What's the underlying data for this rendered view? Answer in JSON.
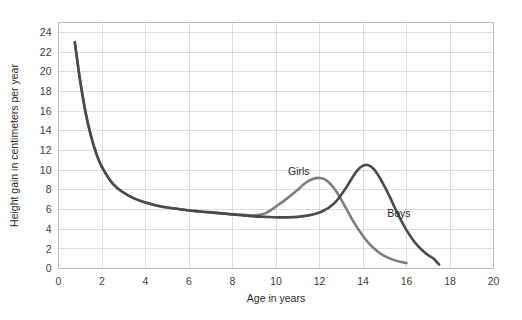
{
  "figure": {
    "background_color": "#ffffff",
    "plot_border_color": "#b9b9b9",
    "grid_color": "#d5d5d5",
    "tick_label_color": "#3c3c3c",
    "axis_title_color": "#2b2b2b"
  },
  "chart_data": {
    "type": "line",
    "title": "",
    "xlabel": "Age in years",
    "ylabel": "Height gain in centimeters per year",
    "xlim": [
      0,
      20
    ],
    "ylim": [
      0,
      25
    ],
    "xticks": [
      0,
      2,
      4,
      6,
      8,
      10,
      12,
      14,
      16,
      18,
      20
    ],
    "xtick_labels": [
      "0",
      "2",
      "4",
      "6",
      "8",
      "10",
      "12",
      "14",
      "16",
      "18",
      "20"
    ],
    "yticks": [
      0,
      2,
      4,
      6,
      8,
      10,
      12,
      14,
      16,
      18,
      20,
      22,
      24
    ],
    "ytick_labels": [
      "0",
      "2",
      "4",
      "6",
      "8",
      "10",
      "12",
      "14",
      "16",
      "18",
      "20",
      "22",
      "24"
    ],
    "grid": true,
    "grid_axes": "both",
    "legend": "inline-annotations",
    "series": [
      {
        "name": "Girls",
        "color": "#7d7d7d",
        "linewidth": 2.6,
        "label_position": {
          "x": 11.05,
          "y": 9.55
        },
        "x": [
          0.75,
          1.0,
          1.25,
          1.5,
          1.75,
          2.0,
          2.5,
          3.0,
          3.5,
          4.0,
          4.5,
          5.0,
          5.5,
          6.0,
          6.5,
          7.0,
          7.5,
          8.0,
          8.5,
          9.0,
          9.25,
          9.5,
          9.75,
          10.0,
          10.5,
          11.0,
          11.25,
          11.5,
          11.75,
          12.0,
          12.25,
          12.5,
          12.75,
          13.0,
          13.25,
          13.5,
          13.75,
          14.0,
          14.25,
          14.5,
          14.75,
          15.0,
          15.25,
          15.5,
          15.75,
          16.0
        ],
        "y": [
          23.0,
          19.0,
          15.8,
          13.4,
          11.6,
          10.3,
          8.6,
          7.7,
          7.1,
          6.7,
          6.4,
          6.2,
          6.05,
          5.9,
          5.8,
          5.7,
          5.6,
          5.5,
          5.45,
          5.4,
          5.45,
          5.6,
          5.9,
          6.3,
          7.1,
          8.0,
          8.5,
          8.9,
          9.15,
          9.2,
          9.05,
          8.6,
          7.9,
          7.0,
          6.0,
          5.0,
          4.1,
          3.3,
          2.6,
          2.05,
          1.6,
          1.25,
          1.0,
          0.8,
          0.65,
          0.55
        ]
      },
      {
        "name": "Boys",
        "color": "#4a4a4a",
        "linewidth": 2.6,
        "label_position": {
          "x": 15.65,
          "y": 5.2
        },
        "x": [
          0.75,
          1.0,
          1.25,
          1.5,
          1.75,
          2.0,
          2.5,
          3.0,
          3.5,
          4.0,
          4.5,
          5.0,
          5.5,
          6.0,
          6.5,
          7.0,
          7.5,
          8.0,
          8.5,
          9.0,
          9.5,
          10.0,
          10.5,
          11.0,
          11.5,
          12.0,
          12.25,
          12.5,
          12.75,
          13.0,
          13.25,
          13.5,
          13.75,
          14.0,
          14.25,
          14.5,
          14.75,
          15.0,
          15.25,
          15.5,
          15.75,
          16.0,
          16.25,
          16.5,
          16.75,
          17.0,
          17.25,
          17.5
        ],
        "y": [
          23.0,
          19.0,
          15.8,
          13.4,
          11.6,
          10.3,
          8.6,
          7.7,
          7.1,
          6.7,
          6.4,
          6.2,
          6.05,
          5.9,
          5.8,
          5.7,
          5.6,
          5.5,
          5.4,
          5.3,
          5.25,
          5.2,
          5.2,
          5.25,
          5.4,
          5.7,
          5.95,
          6.3,
          6.8,
          7.5,
          8.3,
          9.2,
          10.0,
          10.45,
          10.5,
          10.1,
          9.3,
          8.3,
          7.2,
          6.0,
          4.9,
          3.9,
          3.05,
          2.35,
          1.8,
          1.35,
          1.0,
          0.4
        ]
      }
    ]
  }
}
